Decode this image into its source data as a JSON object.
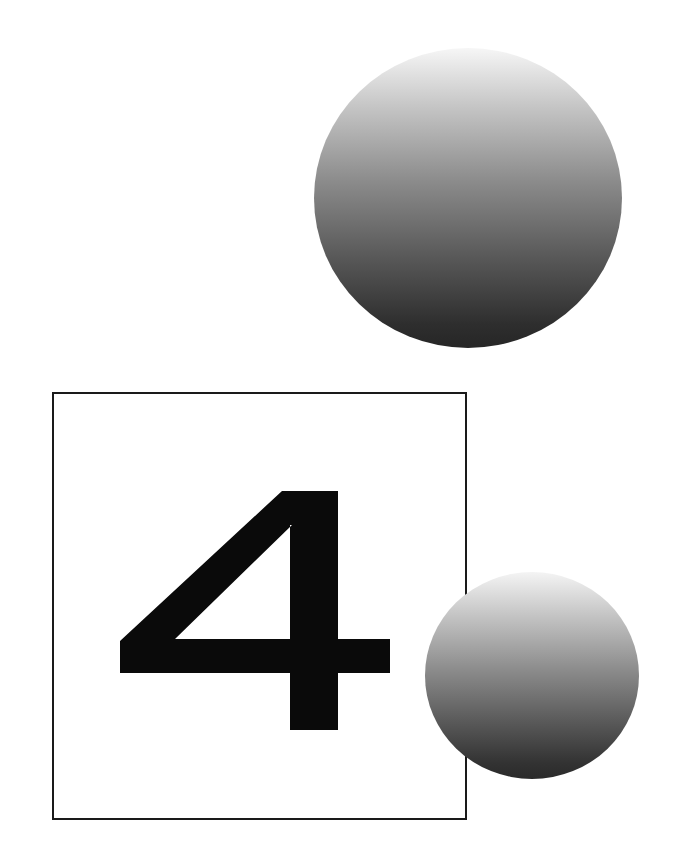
{
  "figure": {
    "numeral": "4",
    "colors": {
      "background": "#ffffff",
      "frame_border": "#1a1a1a",
      "numeral_fill": "#0a0a0a",
      "gradient_top": "#f6f6f6",
      "gradient_mid": "#8a8a8a",
      "gradient_bottom": "#262626"
    },
    "shapes": [
      {
        "name": "large-sphere",
        "type": "circle",
        "fill": "vertical-gradient"
      },
      {
        "name": "framed-square",
        "type": "square",
        "fill": "none"
      },
      {
        "name": "small-sphere",
        "type": "circle",
        "fill": "vertical-gradient"
      }
    ]
  }
}
